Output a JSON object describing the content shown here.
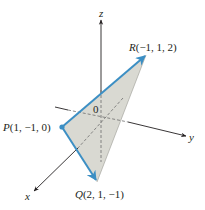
{
  "figure": {
    "type": "3d-coordinate-diagram",
    "axes": {
      "x": {
        "label": "x"
      },
      "y": {
        "label": "y"
      },
      "z": {
        "label": "z"
      },
      "origin_label": "0"
    },
    "points": [
      {
        "id": "P",
        "name": "P",
        "coords": "(1, −1, 0)",
        "label": "P(1, −1, 0)"
      },
      {
        "id": "Q",
        "name": "Q",
        "coords": "(2, 1, −1)",
        "label": "Q(2, 1, −1)"
      },
      {
        "id": "R",
        "name": "R",
        "coords": "(−1, 1, 2)",
        "label": "R(−1, 1, 2)"
      }
    ],
    "triangle": {
      "vertices": [
        "P",
        "Q",
        "R"
      ],
      "vectors": [
        "PQ",
        "PR"
      ]
    },
    "colors": {
      "triangle_fill": "#d9d9d2",
      "vector_edge": "#3c8fc4",
      "axis": "#231f20",
      "hidden_line": "#6d6d6d",
      "background": "#ffffff"
    }
  }
}
